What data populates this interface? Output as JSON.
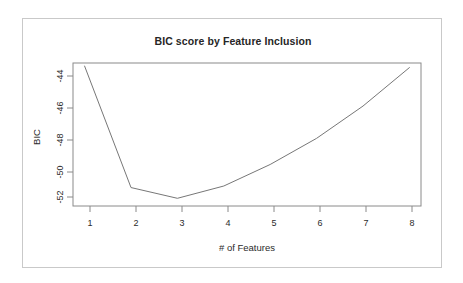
{
  "figure": {
    "title": "BIC score by Feature Inclusion",
    "background_color": "#ffffff",
    "border_color": "#c9c9c9",
    "line_color": "#777777",
    "axis_color": "#8a8a8a"
  },
  "axes": {
    "x_title": "# of Features",
    "y_title": "BIC",
    "x_ticks": [
      "1",
      "2",
      "3",
      "4",
      "5",
      "6",
      "7",
      "8"
    ],
    "y_ticks": [
      "-44",
      "-46",
      "-48",
      "-50",
      "-52"
    ]
  },
  "chart_data": {
    "type": "line",
    "title": "BIC score by Feature Inclusion",
    "xlabel": "# of Features",
    "ylabel": "BIC",
    "x": [
      1,
      2,
      3,
      4,
      5,
      6,
      7,
      8
    ],
    "values": [
      -43.5,
      -51.4,
      -52.1,
      -51.3,
      -49.9,
      -48.2,
      -46.1,
      -43.6
    ],
    "xlim": [
      0.75,
      8.25
    ],
    "ylim": [
      -52.6,
      -43.3
    ],
    "x_ticks": [
      1,
      2,
      3,
      4,
      5,
      6,
      7,
      8
    ],
    "y_ticks": [
      -44,
      -46,
      -48,
      -50,
      -52
    ],
    "grid": false,
    "legend": null,
    "series": [
      {
        "name": "BIC",
        "values": [
          -43.5,
          -51.4,
          -52.1,
          -51.3,
          -49.9,
          -48.2,
          -46.1,
          -43.6
        ]
      }
    ]
  }
}
